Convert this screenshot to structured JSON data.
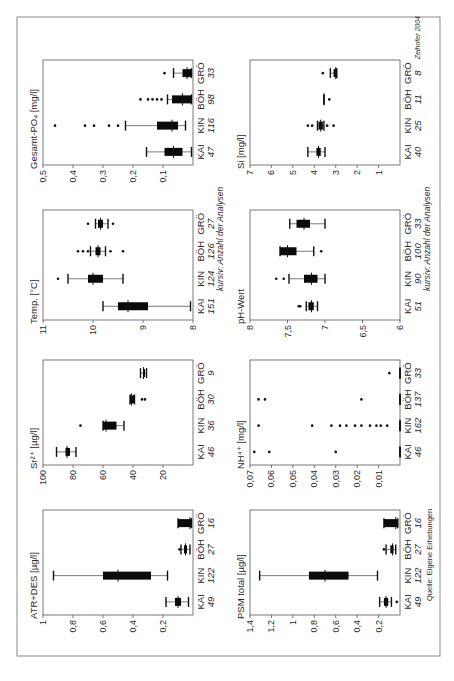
{
  "page": {
    "credit": "Zeihofer 2004",
    "source": "Quelle: Eigene Erhebungen",
    "count_note": "kursiv: Anzahl der Analysen"
  },
  "chart_data": [
    {
      "id": "atr",
      "type": "boxplot",
      "title": "ATR+DES [µg/l]",
      "ylim": [
        0,
        1
      ],
      "yticks": [
        0.2,
        0.4,
        0.6,
        0.8,
        1
      ],
      "ytick_labels": [
        "0,2",
        "0,4",
        "0,6",
        "0,8",
        "1"
      ],
      "categories": [
        "KAI",
        "KIN",
        "BÖH",
        "GRÖ"
      ],
      "counts": [
        "49",
        "122",
        "27",
        "16"
      ],
      "boxes": [
        {
          "low": 0.03,
          "q1": 0.08,
          "median": 0.1,
          "q3": 0.12,
          "high": 0.18,
          "outliers": []
        },
        {
          "low": 0.17,
          "q1": 0.28,
          "median": 0.5,
          "q3": 0.6,
          "high": 0.93,
          "outliers": []
        },
        {
          "low": 0.02,
          "q1": 0.04,
          "median": 0.05,
          "q3": 0.06,
          "high": 0.08,
          "outliers": [
            0.09
          ]
        },
        {
          "low": 0.01,
          "q1": 0.01,
          "median": 0.02,
          "q3": 0.1,
          "high": 0.1,
          "outliers": []
        }
      ]
    },
    {
      "id": "sr",
      "type": "boxplot",
      "title": "Sr²⁺ [µg/l]",
      "ylim": [
        0,
        100
      ],
      "yticks": [
        20,
        40,
        60,
        80,
        100
      ],
      "ytick_labels": [
        "20",
        "40",
        "60",
        "80",
        "100"
      ],
      "categories": [
        "KAI",
        "KIN",
        "BÖH",
        "GRÖ"
      ],
      "counts": [
        "46",
        "36",
        "30",
        "9"
      ],
      "boxes": [
        {
          "low": 78,
          "q1": 82,
          "median": 84,
          "q3": 85,
          "high": 91,
          "outliers": []
        },
        {
          "low": 46,
          "q1": 51,
          "median": 58,
          "q3": 60,
          "high": 60,
          "outliers": [
            75
          ]
        },
        {
          "low": 39,
          "q1": 39,
          "median": 41,
          "q3": 42,
          "high": 42,
          "outliers": [
            34,
            32
          ]
        },
        {
          "low": 31,
          "q1": 32,
          "median": 33,
          "q3": 33,
          "high": 35,
          "outliers": []
        }
      ]
    },
    {
      "id": "temp",
      "type": "boxplot",
      "title": "Temp. [°C]",
      "ylim": [
        8,
        11
      ],
      "yticks": [
        8,
        9,
        10,
        11
      ],
      "ytick_labels": [
        "8",
        "9",
        "10",
        "11"
      ],
      "categories": [
        "KAI",
        "KIN",
        "BÖH",
        "GRÖ"
      ],
      "counts": [
        "151",
        "124",
        "126",
        "27"
      ],
      "boxes": [
        {
          "low": 8.05,
          "q1": 8.9,
          "median": 9.3,
          "q3": 9.5,
          "high": 9.8,
          "outliers": []
        },
        {
          "low": 9.4,
          "q1": 9.8,
          "median": 10.0,
          "q3": 10.1,
          "high": 10.5,
          "outliers": [
            10.7
          ]
        },
        {
          "low": 9.75,
          "q1": 9.85,
          "median": 9.9,
          "q3": 9.95,
          "high": 10.05,
          "outliers": [
            10.1,
            10.2,
            10.3,
            9.65,
            9.4
          ]
        },
        {
          "low": 9.7,
          "q1": 9.8,
          "median": 9.85,
          "q3": 9.9,
          "high": 9.95,
          "outliers": [
            10.1,
            9.6
          ]
        }
      ]
    },
    {
      "id": "po4",
      "type": "boxplot",
      "title": "Gesamt-PO₄ [mg/l]",
      "ylim": [
        0,
        0.5
      ],
      "yticks": [
        0.1,
        0.2,
        0.3,
        0.4,
        0.5
      ],
      "ytick_labels": [
        "0,1",
        "0,2",
        "0,3",
        "0,4",
        "0,5"
      ],
      "categories": [
        "KAI",
        "KIN",
        "BÖH",
        "GRÖ"
      ],
      "counts": [
        "47",
        "116",
        "98",
        "33"
      ],
      "boxes": [
        {
          "low": 0.005,
          "q1": 0.035,
          "median": 0.065,
          "q3": 0.095,
          "high": 0.155,
          "outliers": []
        },
        {
          "low": 0.025,
          "q1": 0.05,
          "median": 0.07,
          "q3": 0.12,
          "high": 0.225,
          "outliers": [
            0.25,
            0.28,
            0.33,
            0.36,
            0.46
          ]
        },
        {
          "low": 0.005,
          "q1": 0.005,
          "median": 0.035,
          "q3": 0.07,
          "high": 0.085,
          "outliers": [
            0.105,
            0.12,
            0.135,
            0.15,
            0.175
          ]
        },
        {
          "low": 0.005,
          "q1": 0.005,
          "median": 0.02,
          "q3": 0.035,
          "high": 0.065,
          "outliers": [
            0.095
          ]
        }
      ]
    },
    {
      "id": "psm",
      "type": "boxplot",
      "title": "PSM total [µg/l]",
      "ylim": [
        0,
        1.4
      ],
      "yticks": [
        0.2,
        0.4,
        0.6,
        0.8,
        1,
        1.2,
        1.4
      ],
      "ytick_labels": [
        "0,2",
        "0,4",
        "0,6",
        "0,8",
        "1",
        "1,2",
        "1,4"
      ],
      "categories": [
        "KAI",
        "KIN",
        "BÖH",
        "GRÖ"
      ],
      "counts": [
        "49",
        "122",
        "27",
        "16"
      ],
      "boxes": [
        {
          "low": 0.08,
          "q1": 0.11,
          "median": 0.13,
          "q3": 0.15,
          "high": 0.19,
          "outliers": [
            0.03
          ]
        },
        {
          "low": 0.21,
          "q1": 0.48,
          "median": 0.7,
          "q3": 0.85,
          "high": 1.31,
          "outliers": []
        },
        {
          "low": 0.04,
          "q1": 0.06,
          "median": 0.07,
          "q3": 0.09,
          "high": 0.13,
          "outliers": [
            0.15
          ]
        },
        {
          "low": 0.02,
          "q1": 0.02,
          "median": 0.04,
          "q3": 0.15,
          "high": 0.15,
          "outliers": []
        }
      ]
    },
    {
      "id": "nh4",
      "type": "boxplot",
      "title": "NH⁴⁺ [mg/l]",
      "ylim": [
        0,
        0.07
      ],
      "yticks": [
        0.01,
        0.02,
        0.03,
        0.04,
        0.05,
        0.06,
        0.07
      ],
      "ytick_labels": [
        "0,01",
        "0,02",
        "0,03",
        "0,04",
        "0,05",
        "0,06",
        "0,07"
      ],
      "categories": [
        "KAI",
        "KIN",
        "BÖH",
        "GRÖ"
      ],
      "counts": [
        "46",
        "162",
        "137",
        "33"
      ],
      "boxes": [
        {
          "low": 0,
          "q1": 0,
          "median": 0,
          "q3": 0,
          "high": 0,
          "outliers": [
            0.068,
            0.061,
            0.03
          ]
        },
        {
          "low": 0,
          "q1": 0,
          "median": 0,
          "q3": 0,
          "high": 0,
          "outliers": [
            0.066,
            0.041,
            0.032,
            0.028,
            0.025,
            0.021,
            0.018,
            0.014,
            0.011,
            0.009,
            0.006
          ]
        },
        {
          "low": 0,
          "q1": 0,
          "median": 0,
          "q3": 0,
          "high": 0,
          "outliers": [
            0.066,
            0.063,
            0.018
          ]
        },
        {
          "low": 0,
          "q1": 0,
          "median": 0,
          "q3": 0,
          "high": 0,
          "outliers": [
            0.005
          ]
        }
      ]
    },
    {
      "id": "ph",
      "type": "boxplot",
      "title": "pH-Wert",
      "ylim": [
        6,
        8
      ],
      "yticks": [
        6,
        6.5,
        7,
        7.5,
        8
      ],
      "ytick_labels": [
        "6",
        "6,5",
        "7",
        "7,5",
        "8"
      ],
      "categories": [
        "KAI",
        "KIN",
        "BÖH",
        "GRÖ"
      ],
      "counts": [
        "51",
        "90",
        "100",
        "33"
      ],
      "boxes": [
        {
          "low": 7.1,
          "q1": 7.15,
          "median": 7.18,
          "q3": 7.22,
          "high": 7.25,
          "outliers": [
            7.33,
            7.35
          ]
        },
        {
          "low": 7.0,
          "q1": 7.1,
          "median": 7.18,
          "q3": 7.28,
          "high": 7.48,
          "outliers": [
            7.55,
            7.65
          ]
        },
        {
          "low": 7.15,
          "q1": 7.38,
          "median": 7.5,
          "q3": 7.6,
          "high": 7.6,
          "outliers": [
            7.05
          ]
        },
        {
          "low": 7.0,
          "q1": 7.2,
          "median": 7.28,
          "q3": 7.38,
          "high": 7.47,
          "outliers": []
        }
      ]
    },
    {
      "id": "si",
      "type": "boxplot",
      "title": "Si [mg/l]",
      "ylim": [
        0,
        7
      ],
      "yticks": [
        1,
        2,
        3,
        4,
        5,
        6,
        7
      ],
      "ytick_labels": [
        "1",
        "2",
        "3",
        "4",
        "5",
        "6",
        "7"
      ],
      "categories": [
        "KAI",
        "KIN",
        "BÖH",
        "GRÖ"
      ],
      "counts": [
        "40",
        "25",
        "11",
        "8"
      ],
      "boxes": [
        {
          "low": 3.5,
          "q1": 3.7,
          "median": 3.8,
          "q3": 3.9,
          "high": 4.3,
          "outliers": []
        },
        {
          "low": 3.55,
          "q1": 3.6,
          "median": 3.7,
          "q3": 3.8,
          "high": 3.85,
          "outliers": [
            4.3,
            4.1,
            3.4,
            3.1
          ]
        },
        {
          "low": 3.55,
          "q1": 3.55,
          "median": 3.55,
          "q3": 3.55,
          "high": 3.55,
          "outliers": [
            3.3
          ]
        },
        {
          "low": 2.95,
          "q1": 2.95,
          "median": 3.0,
          "q3": 3.1,
          "high": 3.25,
          "outliers": [
            3.6
          ]
        }
      ]
    }
  ]
}
